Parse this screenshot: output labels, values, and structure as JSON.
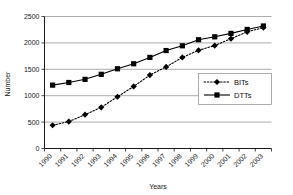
{
  "chart_data": {
    "type": "line",
    "title": "",
    "xlabel": "Years",
    "ylabel": "Number",
    "categories": [
      "1990",
      "1991",
      "1992",
      "1993",
      "1994",
      "1995",
      "1996",
      "1997",
      "1998",
      "1999",
      "2000",
      "2001",
      "2002",
      "2003"
    ],
    "ylim": [
      0,
      2500
    ],
    "y_ticks": [
      0,
      500,
      1000,
      1500,
      2000,
      2500
    ],
    "grid": true,
    "legend_position": "center-right",
    "series": [
      {
        "name": "BITs",
        "marker": "diamond",
        "line_style": "dotted",
        "color": "#000000",
        "values": [
          440,
          510,
          640,
          780,
          980,
          1175,
          1390,
          1545,
          1725,
          1860,
          1950,
          2080,
          2210,
          2290
        ]
      },
      {
        "name": "DTTs",
        "marker": "square",
        "line_style": "solid",
        "color": "#000000",
        "values": [
          1200,
          1250,
          1310,
          1405,
          1510,
          1605,
          1725,
          1855,
          1945,
          2060,
          2115,
          2180,
          2255,
          2320
        ]
      }
    ]
  },
  "axis": {
    "y_tick_labels": [
      "0",
      "500",
      "1000",
      "1500",
      "2000",
      "2500"
    ],
    "x_tick_labels": [
      "1990",
      "1991",
      "1992",
      "1993",
      "1994",
      "1995",
      "1996",
      "1997",
      "1998",
      "1999",
      "2000",
      "2001",
      "2002",
      "2003"
    ],
    "x_title": "Years",
    "y_title": "Number"
  },
  "legend": {
    "entries": [
      {
        "label": "BITs",
        "marker": "diamond-marker",
        "style": "dotted"
      },
      {
        "label": "DTTs",
        "marker": "square-marker",
        "style": "solid"
      }
    ]
  }
}
